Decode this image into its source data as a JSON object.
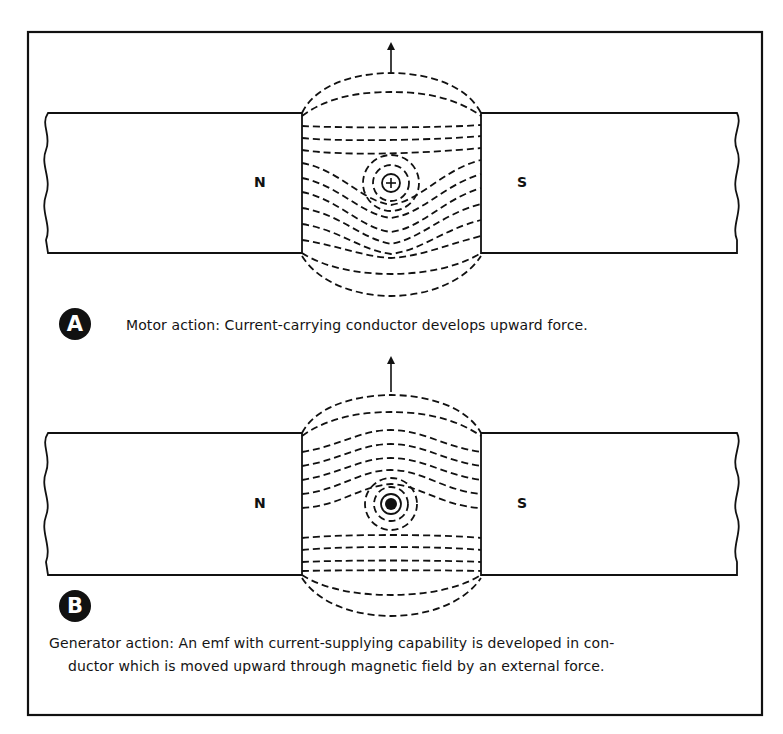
{
  "figure": {
    "panel_a": {
      "badge": "A",
      "caption": "Motor action: Current-carrying conductor develops upward force.",
      "left_pole": "N",
      "right_pole": "S",
      "conductor_symbol": "plus (current into page)",
      "force_direction": "up"
    },
    "panel_b": {
      "badge": "B",
      "caption_line1": "Generator action: An emf with current-supplying capability is developed in con-",
      "caption_line2": "ductor which is moved upward through magnetic field by an external force.",
      "left_pole": "N",
      "right_pole": "S",
      "conductor_symbol": "dot (current out of page)",
      "motion_direction": "up"
    },
    "colors": {
      "ink": "#111111",
      "background": "#ffffff"
    }
  }
}
